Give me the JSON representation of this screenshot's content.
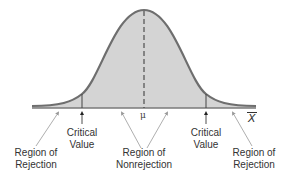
{
  "diagram": {
    "type": "normal-distribution-two-tailed-test",
    "colors": {
      "curve": "#6e6e6e",
      "fill": "#d4d4d4",
      "axis": "#7a7a7a",
      "arrow": "#999999",
      "text": "#333333"
    },
    "center_label": "μ",
    "axis_label": "X",
    "labels": {
      "left_rejection": [
        "Region of",
        "Rejection"
      ],
      "left_critical": [
        "Critical",
        "Value"
      ],
      "nonrejection": [
        "Region of",
        "Nonrejection"
      ],
      "right_critical": [
        "Critical",
        "Value"
      ],
      "right_rejection": [
        "Region of",
        "Rejection"
      ]
    }
  }
}
